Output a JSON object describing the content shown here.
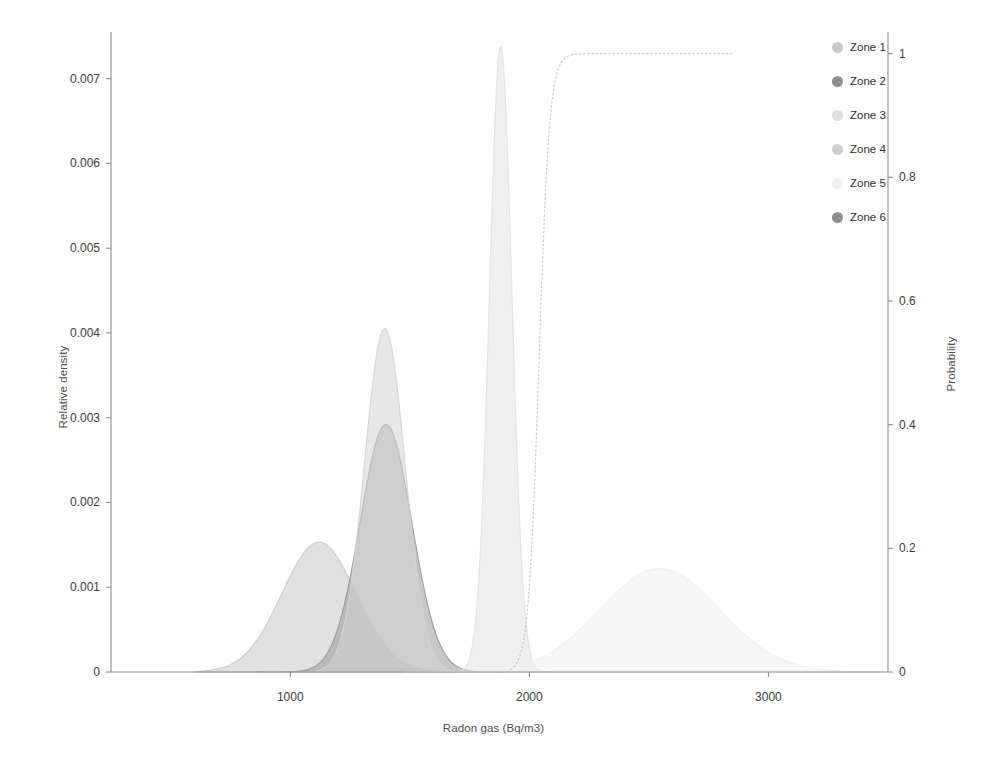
{
  "chart_data": {
    "type": "area",
    "title": "",
    "xlabel": "Radon gas (Bq/m3)",
    "ylabel": "Relative density",
    "ylabel_right": "Probability",
    "xlim": [
      250,
      3500
    ],
    "ylim": [
      0,
      0.00755
    ],
    "ylim_right": [
      0,
      1.035
    ],
    "grid": false,
    "legend_position": "right",
    "xticks": [
      1000,
      2000,
      3000
    ],
    "xticklabels": [
      "1000",
      "2000",
      "3000"
    ],
    "yticks": [
      0,
      0.001,
      0.002,
      0.003,
      0.004,
      0.005,
      0.006,
      0.007
    ],
    "yticklabels": [
      "0",
      "0.001",
      "0.002",
      "0.003",
      "0.004",
      "0.005",
      "0.006",
      "0.007"
    ],
    "yticks_right": [
      0,
      0.2,
      0.4,
      0.6,
      0.8,
      1
    ],
    "yticklabels_right": [
      "0",
      "0.2",
      "0.4",
      "0.6",
      "0.8",
      "1"
    ],
    "series": [
      {
        "name": "Zone 1",
        "color": "#c9c9c9",
        "axis": "left",
        "kind": "density",
        "peak_x": 1120,
        "peak_y": 0.00153,
        "sigma": 155,
        "x_start": 600,
        "x_end": 1700
      },
      {
        "name": "Zone 2",
        "color": "#999999",
        "axis": "left",
        "kind": "density",
        "peak_x": 1400,
        "peak_y": 0.00292,
        "sigma": 108,
        "x_start": 860,
        "x_end": 1880
      },
      {
        "name": "Zone 3",
        "color": "#e2e2e2",
        "axis": "left",
        "kind": "density",
        "peak_x": 1880,
        "peak_y": 0.00738,
        "sigma": 47,
        "x_start": 1640,
        "x_end": 2110
      },
      {
        "name": "Zone 4",
        "color": "#d4d4d4",
        "axis": "left",
        "kind": "density",
        "peak_x": 1395,
        "peak_y": 0.00405,
        "sigma": 85,
        "x_start": 880,
        "x_end": 1820
      },
      {
        "name": "Zone 5",
        "color": "#f0f0f0",
        "axis": "left",
        "kind": "density",
        "peak_x": 2545,
        "peak_y": 0.00122,
        "sigma": 250,
        "x_start": 1480,
        "x_end": 3450
      },
      {
        "name": "Zone 6",
        "color": "#9e9e9e",
        "axis": "right",
        "kind": "cdf",
        "midpoint_x": 2040,
        "scale": 22,
        "x_start": 1920,
        "x_end": 2855,
        "plateau": 1.0,
        "dashed": true
      }
    ]
  },
  "legend": {
    "items": [
      {
        "label": "Zone 1",
        "color": "#c9c9c9"
      },
      {
        "label": "Zone 2",
        "color": "#8f8f8f"
      },
      {
        "label": "Zone 3",
        "color": "#e0e0e0"
      },
      {
        "label": "Zone 4",
        "color": "#cfcfcf"
      },
      {
        "label": "Zone 5",
        "color": "#efefef"
      },
      {
        "label": "Zone 6",
        "color": "#8f8f8f"
      }
    ]
  },
  "axes": {
    "x_title": "Radon gas (Bq/m3)",
    "y_title_left": "Relative density",
    "y_title_right": "Probability"
  }
}
